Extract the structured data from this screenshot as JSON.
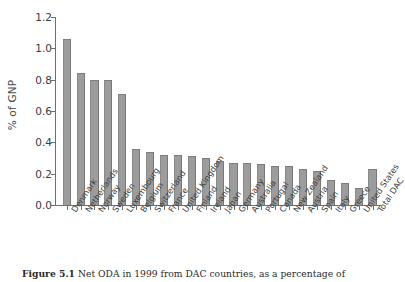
{
  "figure": {
    "caption_bold": "Figure 5.1",
    "caption_text": "Net ODA in 1999 from DAC countries, as a percentage of"
  },
  "chart_data": {
    "type": "bar",
    "title": "",
    "xlabel": "",
    "ylabel": "% of GNP",
    "ylim": [
      0.0,
      1.2
    ],
    "ytick_values": [
      0.0,
      0.2,
      0.4,
      0.6,
      0.8,
      1.0,
      1.2
    ],
    "ytick_labels": [
      "0.0",
      "0.2",
      "0.4",
      "0.6",
      "0.8",
      "1.0",
      "1.2"
    ],
    "grid": false,
    "legend": null,
    "bar_color": "#9c9c9c",
    "categories": [
      "Denmark",
      "Netherlands",
      "Norway",
      "Sweden",
      "Luxembourg",
      "Belgium",
      "Switzerland",
      "France",
      "United Kingdom",
      "Finland",
      "Ireland",
      "Japan",
      "Germany",
      "Australia",
      "Portugal",
      "Canada",
      "New Zealand",
      "Austria",
      "Spain",
      "Italy",
      "Greece",
      "United States",
      "Total DAC"
    ],
    "values": [
      1.06,
      0.84,
      0.8,
      0.8,
      0.71,
      0.36,
      0.34,
      0.32,
      0.32,
      0.31,
      0.3,
      0.28,
      0.27,
      0.27,
      0.26,
      0.25,
      0.25,
      0.23,
      0.22,
      0.16,
      0.14,
      0.11,
      0.23
    ]
  }
}
